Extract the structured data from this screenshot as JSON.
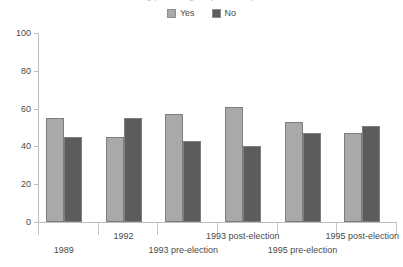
{
  "chart_data": {
    "type": "bar",
    "title": "Voting percentages by election period",
    "subtitle": "",
    "xlabel": "",
    "ylabel": "",
    "ylim": [
      0,
      100
    ],
    "yticks": [
      0,
      20,
      40,
      60,
      80,
      100
    ],
    "ytick_labels": [
      "0",
      "20",
      "40",
      "60",
      "80",
      "100"
    ],
    "grid": false,
    "legend_position": "top-center",
    "categories": [
      "1989",
      "1992",
      "1993 pre-election",
      "1993 post-election",
      "1995 pre-election",
      "1995 post-election"
    ],
    "series": [
      {
        "name": "Yes",
        "color": "#a9a9a9",
        "values": [
          55,
          45,
          57,
          61,
          53,
          47
        ]
      },
      {
        "name": "No",
        "color": "#5c5c5c",
        "values": [
          45,
          55,
          43,
          40,
          47,
          51
        ]
      }
    ]
  },
  "legend": {
    "items": [
      {
        "label": "Yes",
        "swatch_icon": "legend-swatch-icon",
        "color": "#a9a9a9"
      },
      {
        "label": "No",
        "swatch_icon": "legend-swatch-icon",
        "color": "#5c5c5c"
      }
    ]
  }
}
